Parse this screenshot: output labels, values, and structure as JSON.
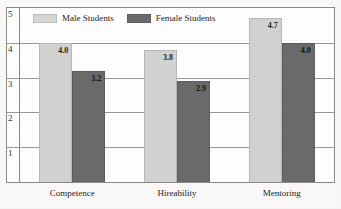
{
  "chart_data": {
    "type": "bar",
    "title": "",
    "xlabel": "",
    "ylabel": "",
    "ylim": [
      0,
      5
    ],
    "yticks": [
      "1",
      "2",
      "3",
      "4",
      "5"
    ],
    "grid": true,
    "legend_position": "top-left",
    "categories": [
      "Competence",
      "Hireability",
      "Mentoring"
    ],
    "series": [
      {
        "name": "Male Students",
        "color": "#d3d3d1",
        "values": [
          4.0,
          3.8,
          4.7
        ],
        "labels": [
          "4.0",
          "3.8",
          "4.7"
        ]
      },
      {
        "name": "Female Students",
        "color": "#6b6b6b",
        "values": [
          3.2,
          2.9,
          4.0
        ],
        "labels": [
          "3.2",
          "2.9",
          "4.0"
        ]
      }
    ]
  }
}
